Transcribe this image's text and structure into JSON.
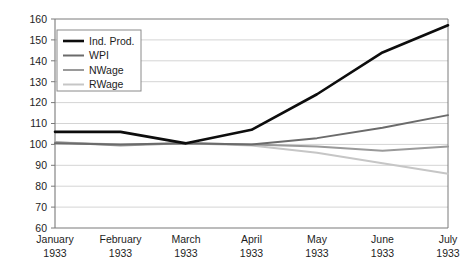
{
  "chart_data": {
    "type": "line",
    "title": "",
    "subtitle": "",
    "xlabel": "",
    "ylabel": "",
    "categories": [
      "January\n1933",
      "February\n1933",
      "March\n1933",
      "April\n1933",
      "May\n1933",
      "June\n1933",
      "July\n1933"
    ],
    "category_lines": [
      {
        "month": "January",
        "year": "1933"
      },
      {
        "month": "February",
        "year": "1933"
      },
      {
        "month": "March",
        "year": "1933"
      },
      {
        "month": "April",
        "year": "1933"
      },
      {
        "month": "May",
        "year": "1933"
      },
      {
        "month": "June",
        "year": "1933"
      },
      {
        "month": "July",
        "year": "1933"
      }
    ],
    "series": [
      {
        "name": "Ind. Prod.",
        "color": "#0d0d0d",
        "width": 2.6,
        "values": [
          106,
          106,
          100.5,
          107,
          124,
          144,
          157
        ]
      },
      {
        "name": "WPI",
        "color": "#6b6b6b",
        "width": 2.0,
        "values": [
          100.5,
          100,
          100.5,
          100,
          103,
          108,
          114
        ]
      },
      {
        "name": "NWage",
        "color": "#9a9a9a",
        "width": 2.0,
        "values": [
          101,
          99.5,
          100.5,
          100,
          99,
          97,
          99
        ]
      },
      {
        "name": "RWage",
        "color": "#c6c6c6",
        "width": 2.0,
        "values": [
          101,
          100,
          100.5,
          99.5,
          96,
          91,
          86
        ]
      }
    ],
    "ylim": [
      60,
      160
    ],
    "yticks": [
      60,
      70,
      80,
      90,
      100,
      110,
      120,
      130,
      140,
      150,
      160
    ],
    "ytick_labels": [
      "60",
      "70",
      "80",
      "90",
      "100",
      "110",
      "120",
      "130",
      "140",
      "150",
      "160"
    ],
    "grid": true,
    "grid_color": "#d4d4d4",
    "axis_color": "#7a7a7a",
    "background": "#ffffff",
    "legend_position": "upper-left",
    "legend_entries": [
      "Ind. Prod.",
      "WPI",
      "NWage",
      "RWage"
    ]
  }
}
